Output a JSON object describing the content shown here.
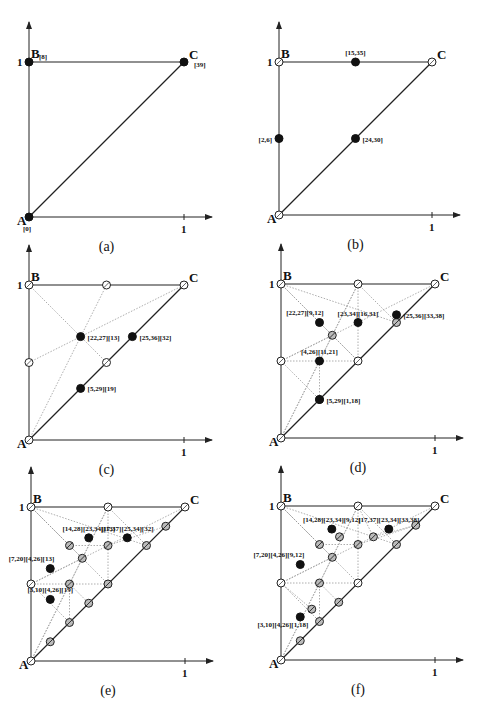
{
  "figure": {
    "panels": [
      {
        "id": "a",
        "caption": "(a)",
        "origin": [
          29,
          217
        ],
        "scale": 155,
        "vertices": {
          "A": {
            "label": "A",
            "tag": "[0]"
          },
          "B": {
            "label": "B",
            "tag": "[8]"
          },
          "C": {
            "label": "C",
            "tag": "[39]"
          }
        },
        "vertex_style": "filled",
        "tick_label": "1",
        "y_tick_label": "1",
        "points": [],
        "dotted": []
      },
      {
        "id": "b",
        "caption": "(b)",
        "origin": [
          279,
          215
        ],
        "scale": 153,
        "vertices": {
          "A": {
            "label": "A",
            "tag": ""
          },
          "B": {
            "label": "B",
            "tag": ""
          },
          "C": {
            "label": "C",
            "tag": ""
          }
        },
        "vertex_style": "open",
        "tick_label": "1",
        "y_tick_label": "1",
        "points": [
          {
            "x": 0.5,
            "y": 1.0,
            "type": "filled",
            "label": "[15,35]",
            "pos": "above"
          },
          {
            "x": 0.0,
            "y": 0.5,
            "type": "filled",
            "label": "[2,6]",
            "pos": "left"
          },
          {
            "x": 0.5,
            "y": 0.5,
            "type": "filled",
            "label": "[24,30]",
            "pos": "right"
          }
        ],
        "dotted": []
      },
      {
        "id": "c",
        "caption": "(c)",
        "origin": [
          29,
          440
        ],
        "scale": 155,
        "vertices": {
          "A": {
            "label": "A",
            "tag": ""
          },
          "B": {
            "label": "B",
            "tag": ""
          },
          "C": {
            "label": "C",
            "tag": ""
          }
        },
        "vertex_style": "open",
        "tick_label": "1",
        "y_tick_label": "1",
        "points": [
          {
            "x": 0.5,
            "y": 1.0,
            "type": "open"
          },
          {
            "x": 0.0,
            "y": 0.5,
            "type": "open"
          },
          {
            "x": 0.5,
            "y": 0.5,
            "type": "open"
          },
          {
            "x": 0.333,
            "y": 0.667,
            "type": "filled",
            "label": "[22,27][13]",
            "pos": "right"
          },
          {
            "x": 0.667,
            "y": 0.667,
            "type": "filled",
            "label": "[25,36][32]",
            "pos": "right"
          },
          {
            "x": 0.333,
            "y": 0.333,
            "type": "filled",
            "label": "[5,29][19]",
            "pos": "right"
          }
        ],
        "dotted": [
          [
            [
              0,
              1
            ],
            [
              0.5,
              0.5
            ]
          ],
          [
            [
              0,
              0
            ],
            [
              0.5,
              1
            ]
          ],
          [
            [
              0,
              0.5
            ],
            [
              1,
              1
            ]
          ]
        ]
      },
      {
        "id": "d",
        "caption": "(d)",
        "origin": [
          281,
          438
        ],
        "scale": 154,
        "vertices": {
          "A": {
            "label": "A",
            "tag": ""
          },
          "B": {
            "label": "B",
            "tag": ""
          },
          "C": {
            "label": "C",
            "tag": ""
          }
        },
        "vertex_style": "open",
        "tick_label": "1",
        "y_tick_label": "1",
        "points": [
          {
            "x": 0.5,
            "y": 1.0,
            "type": "open"
          },
          {
            "x": 0.0,
            "y": 0.5,
            "type": "open"
          },
          {
            "x": 0.5,
            "y": 0.5,
            "type": "open"
          },
          {
            "x": 0.333,
            "y": 0.667,
            "type": "hatched"
          },
          {
            "x": 0.75,
            "y": 0.75,
            "type": "hatched"
          },
          {
            "x": 0.25,
            "y": 0.25,
            "type": "hatched"
          },
          {
            "x": 0.25,
            "y": 0.75,
            "type": "filled",
            "label": "[22,27][9,12]",
            "pos": "aboveleft"
          },
          {
            "x": 0.5,
            "y": 0.75,
            "type": "filled",
            "label": "[23,34][16,31]",
            "pos": "above"
          },
          {
            "x": 0.75,
            "y": 0.8,
            "type": "filled",
            "label": "[25,36][33,38]",
            "pos": "right"
          },
          {
            "x": 0.25,
            "y": 0.5,
            "type": "filled",
            "label": "[4,26][11,21]",
            "pos": "above"
          },
          {
            "x": 0.25,
            "y": 0.25,
            "type": "filled",
            "label": "[5,29][1,18]",
            "pos": "right",
            "dy": -0.08
          }
        ],
        "dotted": [
          [
            [
              0,
              1
            ],
            [
              0.5,
              0.5
            ]
          ],
          [
            [
              0,
              0
            ],
            [
              0.5,
              1
            ]
          ],
          [
            [
              0,
              0.5
            ],
            [
              1,
              1
            ]
          ],
          [
            [
              0,
              1
            ],
            [
              0.333,
              0.667
            ]
          ],
          [
            [
              0.5,
              1
            ],
            [
              0.333,
              0.667
            ]
          ],
          [
            [
              0,
              0.5
            ],
            [
              0.333,
              0.667
            ]
          ],
          [
            [
              0.5,
              0.5
            ],
            [
              0.333,
              0.667
            ]
          ],
          [
            [
              0,
              0.5
            ],
            [
              0.5,
              0.5
            ]
          ],
          [
            [
              0.5,
              0.5
            ],
            [
              0.5,
              1
            ]
          ],
          [
            [
              0,
              1
            ],
            [
              0.75,
              0.75
            ]
          ],
          [
            [
              0.5,
              1
            ],
            [
              0.75,
              0.75
            ]
          ],
          [
            [
              0.5,
              0.5
            ],
            [
              0.75,
              0.75
            ]
          ],
          [
            [
              0,
              0
            ],
            [
              0.25,
              0.5
            ]
          ],
          [
            [
              0.25,
              0.5
            ],
            [
              0.25,
              0.25
            ]
          ],
          [
            [
              0,
              0.5
            ],
            [
              0.25,
              0.25
            ]
          ],
          [
            [
              0.5,
              0.5
            ],
            [
              0.25,
              0.25
            ]
          ],
          [
            [
              0.25,
              0.5
            ],
            [
              0.333,
              0.667
            ]
          ]
        ]
      },
      {
        "id": "e",
        "caption": "(e)",
        "origin": [
          31,
          661
        ],
        "scale": 154,
        "vertices": {
          "A": {
            "label": "A",
            "tag": ""
          },
          "B": {
            "label": "B",
            "tag": ""
          },
          "C": {
            "label": "C",
            "tag": ""
          }
        },
        "vertex_style": "open",
        "tick_label": "1",
        "y_tick_label": "1",
        "points": [
          {
            "x": 0.5,
            "y": 1.0,
            "type": "open"
          },
          {
            "x": 0.0,
            "y": 0.5,
            "type": "open"
          },
          {
            "x": 0.5,
            "y": 0.5,
            "type": "hatched"
          },
          {
            "x": 0.25,
            "y": 0.75,
            "type": "hatched"
          },
          {
            "x": 0.5,
            "y": 0.75,
            "type": "hatched"
          },
          {
            "x": 0.25,
            "y": 0.5,
            "type": "hatched"
          },
          {
            "x": 0.333,
            "y": 0.667,
            "type": "hatched"
          },
          {
            "x": 0.75,
            "y": 0.75,
            "type": "hatched"
          },
          {
            "x": 0.25,
            "y": 0.25,
            "type": "hatched"
          },
          {
            "x": 0.375,
            "y": 0.375,
            "type": "hatched"
          },
          {
            "x": 0.875,
            "y": 0.875,
            "type": "hatched"
          },
          {
            "x": 0.125,
            "y": 0.125,
            "type": "hatched"
          },
          {
            "x": 0.375,
            "y": 0.8,
            "type": "filled",
            "label": "[14,28][23,34][13]",
            "pos": "above"
          },
          {
            "x": 0.625,
            "y": 0.8,
            "type": "filled",
            "label": "[17,37][25,34][32]",
            "pos": "above"
          },
          {
            "x": 0.125,
            "y": 0.6,
            "type": "filled",
            "label": "[7,20][4,26][13]",
            "pos": "aboveleft"
          },
          {
            "x": 0.125,
            "y": 0.4,
            "type": "filled",
            "label": "[3,10][4,26][19]",
            "pos": "above"
          }
        ],
        "dotted": [
          [
            [
              0,
              1
            ],
            [
              0.5,
              0.5
            ]
          ],
          [
            [
              0,
              0
            ],
            [
              0.5,
              1
            ]
          ],
          [
            [
              0,
              0.5
            ],
            [
              1,
              1
            ]
          ],
          [
            [
              0,
              1
            ],
            [
              0.333,
              0.667
            ]
          ],
          [
            [
              0.5,
              1
            ],
            [
              0.333,
              0.667
            ]
          ],
          [
            [
              0,
              0.5
            ],
            [
              0.333,
              0.667
            ]
          ],
          [
            [
              0,
              0.5
            ],
            [
              0.5,
              0.5
            ]
          ],
          [
            [
              0.5,
              0.5
            ],
            [
              0.5,
              1
            ]
          ],
          [
            [
              0,
              1
            ],
            [
              0.75,
              0.75
            ]
          ],
          [
            [
              0.5,
              1
            ],
            [
              0.75,
              0.75
            ]
          ],
          [
            [
              0.5,
              0.5
            ],
            [
              0.75,
              0.75
            ]
          ],
          [
            [
              0,
              0
            ],
            [
              0.25,
              0.5
            ]
          ],
          [
            [
              0.25,
              0.5
            ],
            [
              0.25,
              0.25
            ]
          ],
          [
            [
              0,
              0.5
            ],
            [
              0.25,
              0.25
            ]
          ],
          [
            [
              0.25,
              0.5
            ],
            [
              0.333,
              0.667
            ]
          ],
          [
            [
              0,
              1
            ],
            [
              0.25,
              0.75
            ]
          ],
          [
            [
              0.25,
              0.75
            ],
            [
              0.5,
              0.75
            ]
          ],
          [
            [
              0.5,
              0.75
            ],
            [
              0.875,
              0.875
            ]
          ],
          [
            [
              0.25,
              0.5
            ],
            [
              0.375,
              0.375
            ]
          ]
        ]
      },
      {
        "id": "f",
        "caption": "(f)",
        "origin": [
          281,
          660
        ],
        "scale": 154,
        "vertices": {
          "A": {
            "label": "A",
            "tag": ""
          },
          "B": {
            "label": "B",
            "tag": ""
          },
          "C": {
            "label": "C",
            "tag": ""
          }
        },
        "vertex_style": "open",
        "tick_label": "1",
        "y_tick_label": "1",
        "points": [
          {
            "x": 0.5,
            "y": 1.0,
            "type": "open"
          },
          {
            "x": 0.0,
            "y": 0.5,
            "type": "open"
          },
          {
            "x": 0.5,
            "y": 0.5,
            "type": "open"
          },
          {
            "x": 0.25,
            "y": 0.75,
            "type": "hatched"
          },
          {
            "x": 0.5,
            "y": 0.75,
            "type": "hatched"
          },
          {
            "x": 0.25,
            "y": 0.5,
            "type": "hatched"
          },
          {
            "x": 0.333,
            "y": 0.667,
            "type": "hatched"
          },
          {
            "x": 0.75,
            "y": 0.75,
            "type": "hatched"
          },
          {
            "x": 0.25,
            "y": 0.25,
            "type": "hatched"
          },
          {
            "x": 0.375,
            "y": 0.375,
            "type": "hatched"
          },
          {
            "x": 0.875,
            "y": 0.875,
            "type": "hatched"
          },
          {
            "x": 0.125,
            "y": 0.125,
            "type": "hatched"
          },
          {
            "x": 0.6,
            "y": 0.8,
            "type": "hatched"
          },
          {
            "x": 0.38,
            "y": 0.8,
            "type": "hatched"
          },
          {
            "x": 0.2,
            "y": 0.33,
            "type": "hatched"
          },
          {
            "x": 0.33,
            "y": 0.85,
            "type": "filled",
            "label": "[14,28][23,34][9,12]",
            "pos": "above"
          },
          {
            "x": 0.7,
            "y": 0.85,
            "type": "filled",
            "label": "[17,37][23,34][33,38]",
            "pos": "above"
          },
          {
            "x": 0.125,
            "y": 0.62,
            "type": "filled",
            "label": "[7,20][4,26][9,12]",
            "pos": "aboveleft"
          },
          {
            "x": 0.125,
            "y": 0.28,
            "type": "filled",
            "label": "[3,10][4,26][1,18]",
            "pos": "belowleft"
          }
        ],
        "dotted": [
          [
            [
              0,
              1
            ],
            [
              0.5,
              0.5
            ]
          ],
          [
            [
              0,
              0
            ],
            [
              0.5,
              1
            ]
          ],
          [
            [
              0,
              0.5
            ],
            [
              1,
              1
            ]
          ],
          [
            [
              0,
              1
            ],
            [
              0.333,
              0.667
            ]
          ],
          [
            [
              0.5,
              1
            ],
            [
              0.333,
              0.667
            ]
          ],
          [
            [
              0,
              0.5
            ],
            [
              0.333,
              0.667
            ]
          ],
          [
            [
              0,
              0.5
            ],
            [
              0.5,
              0.5
            ]
          ],
          [
            [
              0.5,
              0.5
            ],
            [
              0.5,
              1
            ]
          ],
          [
            [
              0,
              1
            ],
            [
              0.75,
              0.75
            ]
          ],
          [
            [
              0.5,
              1
            ],
            [
              0.75,
              0.75
            ]
          ],
          [
            [
              0.5,
              0.5
            ],
            [
              0.75,
              0.75
            ]
          ],
          [
            [
              0,
              0
            ],
            [
              0.25,
              0.5
            ]
          ],
          [
            [
              0.25,
              0.5
            ],
            [
              0.25,
              0.25
            ]
          ],
          [
            [
              0,
              0.5
            ],
            [
              0.25,
              0.25
            ]
          ],
          [
            [
              0.25,
              0.5
            ],
            [
              0.333,
              0.667
            ]
          ],
          [
            [
              0,
              1
            ],
            [
              0.25,
              0.75
            ]
          ],
          [
            [
              0.25,
              0.75
            ],
            [
              0.5,
              0.75
            ]
          ],
          [
            [
              0.5,
              0.75
            ],
            [
              0.875,
              0.875
            ]
          ],
          [
            [
              0.25,
              0.5
            ],
            [
              0.375,
              0.375
            ]
          ],
          [
            [
              0.5,
              1
            ],
            [
              0.6,
              0.8
            ]
          ],
          [
            [
              0.6,
              0.8
            ],
            [
              0.875,
              0.875
            ]
          ],
          [
            [
              0,
              0.5
            ],
            [
              0.2,
              0.33
            ]
          ]
        ]
      }
    ]
  }
}
